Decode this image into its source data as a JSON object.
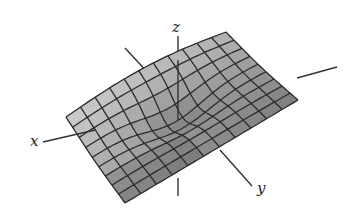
{
  "figure": {
    "background": "#ffffff",
    "surface_fill_light": "#c8c8c8",
    "surface_fill_dark": "#8a8a8a",
    "mesh_color": "#2a2a2a",
    "axis_color": "#333333",
    "grid": {
      "rows": 9,
      "cols": 11
    }
  },
  "axes": {
    "x": {
      "label": "x"
    },
    "y": {
      "label": "y"
    },
    "z": {
      "label": "z"
    }
  }
}
